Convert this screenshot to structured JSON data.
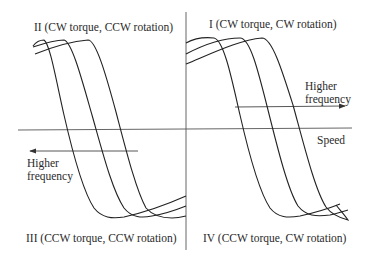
{
  "figure": {
    "type": "four-quadrant torque-speed characteristic",
    "axes": {
      "horizontal_label": "Speed",
      "vertical_label": ""
    },
    "quadrants": {
      "q1": "I (CW torque, CW rotation)",
      "q2": "II (CW torque, CCW rotation)",
      "q3": "III (CCW torque, CCW rotation)",
      "q4": "IV (CCW torque, CW rotation)"
    },
    "annotations": {
      "right_arrow": {
        "line1": "Higher",
        "line2": "frequency",
        "direction": "right"
      },
      "left_arrow": {
        "line1": "Higher",
        "line2": "frequency",
        "direction": "left"
      }
    },
    "curve_families": {
      "right_half_count": 3,
      "left_half_count": 3
    },
    "colors": {
      "ink": "#222222",
      "axis": "#555555",
      "background": "#ffffff"
    }
  }
}
